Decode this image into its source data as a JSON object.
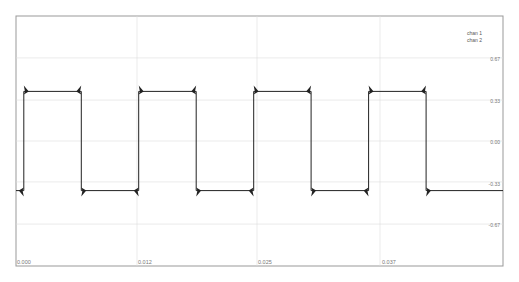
{
  "chart_data": {
    "type": "line",
    "title": "",
    "xlabel": "",
    "ylabel": "",
    "x_ticks": [
      "0.000",
      "0.012",
      "0.025",
      "0.037"
    ],
    "y_ticks": [
      "0.67",
      "0.33",
      "0.00",
      "-0.33",
      "-0.67"
    ],
    "xlim": [
      0.0,
      0.05
    ],
    "ylim": [
      -1.0,
      1.0
    ],
    "grid": true,
    "legend": [
      "chan 1",
      "chan 2"
    ],
    "legend_position": "upper right",
    "series": [
      {
        "name": "chan 1",
        "shape": "square wave with overshoot spikes at edges",
        "high": 0.4,
        "low": -0.4,
        "period": 0.0118,
        "x": [
          0.0,
          0.0008,
          0.0008,
          0.0067,
          0.0067,
          0.0126,
          0.0126,
          0.0185,
          0.0185,
          0.0244,
          0.0244,
          0.0303,
          0.0303,
          0.0362,
          0.0362,
          0.0421,
          0.0421,
          0.05
        ],
        "y": [
          -0.4,
          -0.4,
          0.4,
          0.4,
          -0.4,
          -0.4,
          0.4,
          0.4,
          -0.4,
          -0.4,
          0.4,
          0.4,
          -0.4,
          -0.4,
          0.4,
          0.4,
          -0.4,
          -0.4
        ]
      },
      {
        "name": "chan 2",
        "shape": "not visible",
        "x": [],
        "y": []
      }
    ]
  },
  "legend": {
    "item1": "chan 1",
    "item2": "chan 2"
  },
  "axes": {
    "y_labels": [
      "0.67",
      "0.33",
      "0.00",
      "-0.33",
      "-0.67"
    ],
    "x_labels": [
      "0.000",
      "0.012",
      "0.025",
      "0.037"
    ]
  },
  "colors": {
    "trace": "#222222",
    "grid": "#dddddd",
    "frame": "#888888"
  }
}
